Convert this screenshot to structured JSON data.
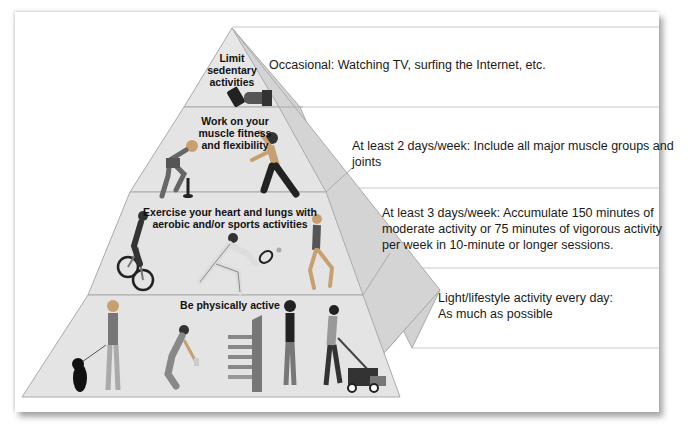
{
  "diagram": {
    "colors": {
      "front_face": "#e4e4e4",
      "side_face": "#cfcfcf",
      "edge": "#a8a8a8",
      "separator": "#c8c8c8",
      "text": "#1a1a1a"
    },
    "tiers": [
      {
        "level": 4,
        "label": "Limit sedentary activities",
        "label_lines": [
          "Limit",
          "sedentary",
          "activities"
        ],
        "description": "Occasional: Watching TV, surfing the Internet, etc.",
        "illustrations": [
          "hand-holding-remote"
        ]
      },
      {
        "level": 3,
        "label": "Work on your muscle fitness and flexibility",
        "label_lines": [
          "Work on your",
          "muscle fitness",
          "and flexibility"
        ],
        "description": "At least 2 days/week: Include all major muscle groups and joints",
        "illustrations": [
          "woman-lifting-dumbbell",
          "man-stretching"
        ]
      },
      {
        "level": 2,
        "label": "Exercise your heart and lungs with aerobic and/or sports activities",
        "label_lines": [
          "Exercise your heart and lungs with",
          "aerobic and/or sports activities"
        ],
        "description": "At least 3 days/week: Accumulate 150 minutes of moderate activity or 75 minutes of vigorous activity per week in 10-minute or longer sessions.",
        "description_lines": [
          "At least 3 days/week: Accumulate 150 minutes of",
          "moderate activity or 75 minutes of vigorous activity",
          "per week in 10-minute or longer sessions."
        ],
        "illustrations": [
          "cyclist",
          "tennis-player",
          "runner"
        ]
      },
      {
        "level": 1,
        "label": "Be physically active",
        "label_lines": [
          "Be physically active"
        ],
        "description": "Light/lifestyle activity every day: As much as possible",
        "description_lines": [
          "Light/lifestyle activity every day:",
          "As much as possible"
        ],
        "illustrations": [
          "woman-walking-dog",
          "person-gardening",
          "person-taking-stairs",
          "man-mowing-lawn"
        ]
      }
    ]
  }
}
